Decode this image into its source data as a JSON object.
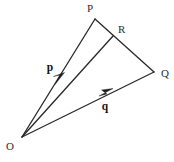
{
  "figure": {
    "background_color": "#ffffff",
    "line_color": "#2b2b2b",
    "label_color": "#2b2b2b"
  },
  "points": {
    "O": {
      "label": "O",
      "x": 22,
      "y": 137,
      "label_x": 10,
      "label_y": 150
    },
    "P": {
      "label": "P",
      "x": 95,
      "y": 19,
      "label_x": 90,
      "label_y": 12
    },
    "Q": {
      "label": "Q",
      "x": 154,
      "y": 72,
      "label_x": 161,
      "label_y": 77
    },
    "R": {
      "label": "R",
      "x": 113,
      "y": 36,
      "label_x": 118,
      "label_y": 33
    }
  },
  "vectors": {
    "p": {
      "label": "p",
      "from": "O",
      "to": "P",
      "label_x": 50,
      "label_y": 71,
      "arrow_x": 61,
      "arrow_y": 79
    },
    "q": {
      "label": "q",
      "from": "O",
      "to": "Q",
      "label_x": 105,
      "label_y": 110,
      "arrow_x": 106,
      "arrow_y": 94
    }
  },
  "segments": [
    {
      "name": "segment-OP",
      "from": "O",
      "to": "P"
    },
    {
      "name": "segment-OR",
      "from": "O",
      "to": "R"
    },
    {
      "name": "segment-OQ",
      "from": "O",
      "to": "Q"
    },
    {
      "name": "segment-PQ",
      "from": "P",
      "to": "Q"
    }
  ]
}
